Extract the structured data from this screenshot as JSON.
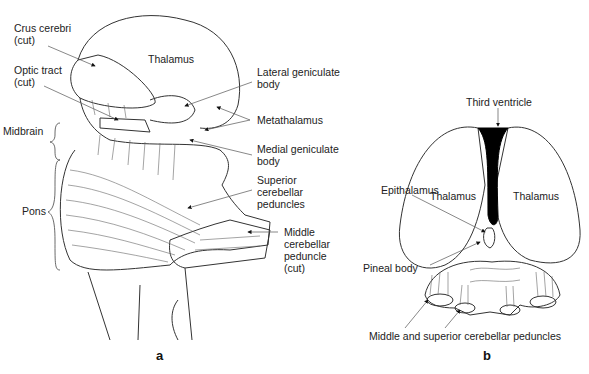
{
  "panel_a": {
    "letter": "a",
    "labels": {
      "crus_cerebri": "Crus cerebri\n(cut)",
      "thalamus": "Thalamus",
      "optic_tract": "Optic tract\n(cut)",
      "lateral_geniculate": "Lateral geniculate\nbody",
      "metathalamus": "Metathalamus",
      "midbrain": "Midbrain",
      "medial_geniculate": "Medial geniculate\nbody",
      "superior_cerebellar": "Superior\ncerebellar\npeduncles",
      "pons": "Pons",
      "middle_cerebellar": "Middle\ncerebellar\npeduncle\n(cut)"
    }
  },
  "panel_b": {
    "letter": "b",
    "labels": {
      "third_ventricle": "Third ventricle",
      "epithalamus": "Epithalamus",
      "thalamus_left": "Thalamus",
      "thalamus_right": "Thalamus",
      "pineal_body": "Pineal body",
      "cerebellar_peduncles": "Middle and superior cerebellar peduncles"
    }
  },
  "colors": {
    "line": "#333333",
    "ventricle": "#000000",
    "background": "#ffffff"
  }
}
